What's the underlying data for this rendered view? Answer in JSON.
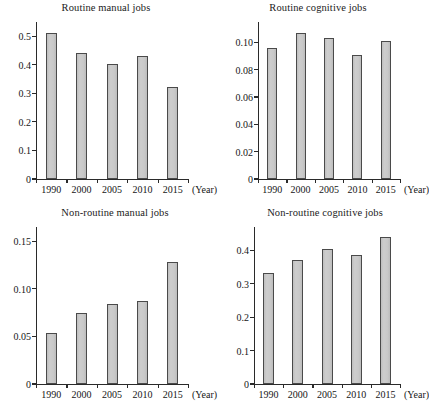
{
  "figure": {
    "background": "#ffffff",
    "bar_fill": "#c6c6c6",
    "bar_stroke": "#4a4a4a",
    "axis_color": "#2a2a2a",
    "x_unit_label": "(Year)"
  },
  "chart_data": [
    {
      "type": "bar",
      "id": "routine-manual-jobs",
      "title": "Routine manual jobs",
      "xlabel": "(Year)",
      "ylabel": "",
      "categories": [
        "1990",
        "2000",
        "2005",
        "2010",
        "2015"
      ],
      "values": [
        0.513,
        0.441,
        0.402,
        0.43,
        0.324
      ],
      "ylim": [
        0,
        0.55
      ],
      "yticks": [
        0,
        0.1,
        0.2,
        0.3,
        0.4,
        0.5
      ],
      "ytick_labels": [
        "0",
        "0.1",
        "0.2",
        "0.3",
        "0.4",
        "0.5"
      ],
      "grid": false,
      "legend": "none"
    },
    {
      "type": "bar",
      "id": "routine-cognitive-jobs",
      "title": "Routine cognitive jobs",
      "xlabel": "(Year)",
      "ylabel": "",
      "categories": [
        "1990",
        "2000",
        "2005",
        "2010",
        "2015"
      ],
      "values": [
        0.096,
        0.107,
        0.103,
        0.091,
        0.101
      ],
      "ylim": [
        0,
        0.115
      ],
      "yticks": [
        0,
        0.02,
        0.04,
        0.06,
        0.08,
        0.1
      ],
      "ytick_labels": [
        "0",
        "0.02",
        "0.04",
        "0.06",
        "0.08",
        "0.10"
      ],
      "grid": false,
      "legend": "none"
    },
    {
      "type": "bar",
      "id": "non-routine-manual-jobs",
      "title": "Non-routine manual jobs",
      "xlabel": "(Year)",
      "ylabel": "",
      "categories": [
        "1990",
        "2000",
        "2005",
        "2010",
        "2015"
      ],
      "values": [
        0.054,
        0.075,
        0.084,
        0.087,
        0.128
      ],
      "ylim": [
        0,
        0.165
      ],
      "yticks": [
        0,
        0.05,
        0.1,
        0.15
      ],
      "ytick_labels": [
        "0",
        "0.05",
        "0.10",
        "0.15"
      ],
      "grid": false,
      "legend": "none"
    },
    {
      "type": "bar",
      "id": "non-routine-cognitive-jobs",
      "title": "Non-routine cognitive jobs",
      "xlabel": "(Year)",
      "ylabel": "",
      "categories": [
        "1990",
        "2000",
        "2005",
        "2010",
        "2015"
      ],
      "values": [
        0.333,
        0.37,
        0.405,
        0.385,
        0.44
      ],
      "ylim": [
        0,
        0.47
      ],
      "yticks": [
        0,
        0.1,
        0.2,
        0.3,
        0.4
      ],
      "ytick_labels": [
        "0",
        "0.1",
        "0.2",
        "0.3",
        "0.4"
      ],
      "grid": false,
      "legend": "none"
    }
  ]
}
